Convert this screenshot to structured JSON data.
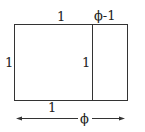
{
  "diagram": {
    "labels": {
      "top_left": "1",
      "top_right": "ϕ-1",
      "left_side": "1",
      "divider": "1",
      "bottom": "1",
      "total_width": "ϕ"
    },
    "geometry": {
      "rect": {
        "x": 14,
        "y": 24,
        "width": 113,
        "height": 76
      },
      "divider_x": 92,
      "arrow": {
        "y": 118,
        "x1": 16,
        "x2": 125
      }
    },
    "colors": {
      "stroke": "#333333",
      "background": "#ffffff"
    }
  }
}
